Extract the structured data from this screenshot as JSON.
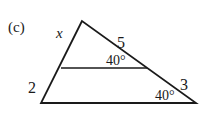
{
  "figure": {
    "part_label": "(c)",
    "side_labels": {
      "upper_left_segment": "x",
      "lower_left_segment": "2",
      "upper_right_segment": "5",
      "lower_right_segment": "3"
    },
    "angle_labels": {
      "inner_line_right_angle": "40°",
      "bottom_right_angle": "40°"
    },
    "stroke_color": "#1a1a1a"
  }
}
